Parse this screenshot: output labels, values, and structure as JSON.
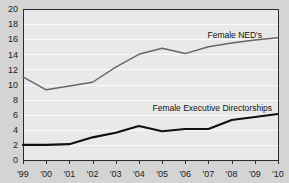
{
  "chart_data": {
    "type": "line",
    "title": "",
    "xlabel": "",
    "ylabel": "",
    "ylim": [
      0,
      20
    ],
    "yticks": [
      0,
      2,
      4,
      6,
      8,
      10,
      12,
      14,
      16,
      18,
      20
    ],
    "ytick_labels": [
      "0",
      "2",
      "4",
      "6",
      "8",
      "10",
      "12",
      "14",
      "16",
      "18",
      "20"
    ],
    "grid": true,
    "grid_orientation": "horizontal",
    "legend_position": "inline-annotation",
    "x": [
      "'99",
      "'00",
      "'01",
      "'02",
      "'03",
      "'04",
      "'05",
      "'06",
      "'07",
      "'08",
      "'09",
      "'10"
    ],
    "xtick_labels": [
      "'99",
      "'00",
      "'01",
      "'02",
      "'03",
      "'04",
      "'05",
      "'06",
      "'07",
      "'08",
      "'09",
      "'10"
    ],
    "series": [
      {
        "name": "Female NED's",
        "color": "#666666",
        "values": [
          11.0,
          9.3,
          9.8,
          10.3,
          12.3,
          14.0,
          14.8,
          14.1,
          15.0,
          15.5,
          15.9,
          16.2
        ]
      },
      {
        "name": "Female Executive Directorships",
        "color": "#101010",
        "values": [
          2.0,
          2.0,
          2.1,
          3.0,
          3.6,
          4.5,
          3.8,
          4.1,
          4.1,
          5.3,
          5.7,
          6.1
        ]
      }
    ],
    "annotations": [
      {
        "text": "Female NED's",
        "x": 262,
        "y": 38
      },
      {
        "text": "Female Executive Directorships",
        "x": 272,
        "y": 111
      }
    ],
    "colors": {
      "plot_background": "#e9e9e9",
      "figure_background": "#d4d4d4",
      "gridline": "#fafafa",
      "axis": "#2b2b2b"
    }
  }
}
